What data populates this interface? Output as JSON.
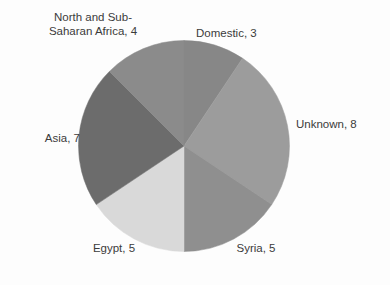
{
  "chart_data": {
    "type": "pie",
    "title": "",
    "total": 32,
    "categories": [
      "Domestic",
      "Unknown",
      "Syria",
      "Egypt",
      "Asia",
      "North and Sub-Saharan Africa"
    ],
    "values": [
      3,
      8,
      5,
      5,
      7,
      4
    ],
    "slice_colors": [
      "#878787",
      "#9c9c9c",
      "#8f8f8f",
      "#d9d9d9",
      "#6c6c6c",
      "#8b8b8b"
    ],
    "start_angle_deg": 0,
    "direction": "clockwise",
    "legend": "none",
    "labels_position": "outside",
    "data_labels": [
      "Domestic, 3",
      "Unknown, 8",
      "Syria, 5",
      "Egypt, 5",
      "Asia, 7",
      "North and Sub-\nSaharan Africa, 4"
    ],
    "grid": false,
    "xlabel": "",
    "ylabel": ""
  },
  "labels": {
    "africa": "North and Sub-\nSaharan Africa, 4",
    "domestic": "Domestic, 3",
    "unknown": "Unknown, 8",
    "asia": "Asia, 7",
    "egypt": "Egypt, 5",
    "syria": "Syria, 5"
  },
  "artifacts": {
    "a1": "",
    "a2": "",
    "a3": "",
    "a4": "",
    "a5": "",
    "a6": "",
    "a7": ""
  }
}
